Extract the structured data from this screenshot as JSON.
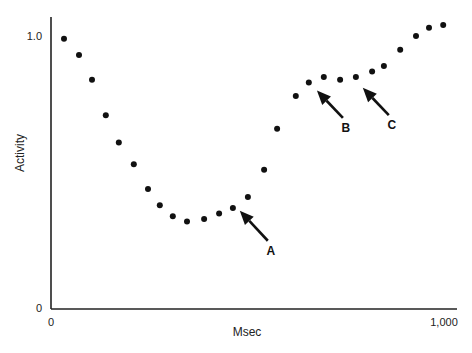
{
  "chart_data": {
    "type": "scatter",
    "title": "",
    "xlabel": "Msec",
    "ylabel": "Activity",
    "xlim": [
      0,
      1000
    ],
    "ylim": [
      0,
      1.0
    ],
    "grid": false,
    "legend": null,
    "x_ticks": [
      {
        "value": 0,
        "label": "0"
      },
      {
        "value": 1000,
        "label": "1,000"
      }
    ],
    "y_ticks": [
      {
        "value": 0,
        "label": "0"
      },
      {
        "value": 1.0,
        "label": "1.0"
      }
    ],
    "series": [
      {
        "name": "Activity",
        "marker": "filled-circle",
        "color": "#111111",
        "points": [
          {
            "x": 32,
            "y": 0.99
          },
          {
            "x": 69,
            "y": 0.93
          },
          {
            "x": 101,
            "y": 0.84
          },
          {
            "x": 135,
            "y": 0.71
          },
          {
            "x": 167,
            "y": 0.61
          },
          {
            "x": 204,
            "y": 0.53
          },
          {
            "x": 239,
            "y": 0.44
          },
          {
            "x": 268,
            "y": 0.38
          },
          {
            "x": 300,
            "y": 0.34
          },
          {
            "x": 335,
            "y": 0.32
          },
          {
            "x": 377,
            "y": 0.33
          },
          {
            "x": 414,
            "y": 0.35
          },
          {
            "x": 448,
            "y": 0.37
          },
          {
            "x": 485,
            "y": 0.41
          },
          {
            "x": 525,
            "y": 0.51
          },
          {
            "x": 557,
            "y": 0.66
          },
          {
            "x": 603,
            "y": 0.78
          },
          {
            "x": 635,
            "y": 0.83
          },
          {
            "x": 672,
            "y": 0.85
          },
          {
            "x": 712,
            "y": 0.84
          },
          {
            "x": 751,
            "y": 0.85
          },
          {
            "x": 791,
            "y": 0.87
          },
          {
            "x": 820,
            "y": 0.89
          },
          {
            "x": 860,
            "y": 0.95
          },
          {
            "x": 899,
            "y": 1.0
          },
          {
            "x": 931,
            "y": 1.03
          },
          {
            "x": 966,
            "y": 1.04
          }
        ]
      }
    ],
    "annotations": [
      {
        "label": "A",
        "points_to": {
          "x": 465,
          "y": 0.36
        },
        "arrow_from": {
          "x": 534,
          "y": 0.25
        }
      },
      {
        "label": "B",
        "points_to": {
          "x": 655,
          "y": 0.8
        },
        "arrow_from": {
          "x": 719,
          "y": 0.7
        }
      },
      {
        "label": "C",
        "points_to": {
          "x": 768,
          "y": 0.81
        },
        "arrow_from": {
          "x": 832,
          "y": 0.71
        }
      }
    ]
  }
}
